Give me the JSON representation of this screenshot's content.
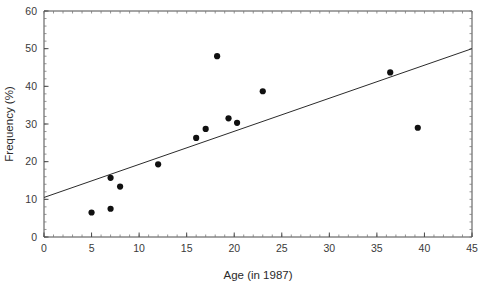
{
  "chart_data": {
    "type": "scatter",
    "title": "",
    "xlabel": "Age (in 1987)",
    "ylabel": "Frequency (%)",
    "xlim": [
      0,
      45
    ],
    "ylim": [
      0,
      60
    ],
    "xticks": [
      0,
      5,
      10,
      15,
      20,
      25,
      30,
      35,
      40,
      45
    ],
    "yticks": [
      0,
      10,
      20,
      30,
      40,
      50,
      60
    ],
    "xtick_labels": [
      "0",
      "5",
      "10",
      "15",
      "20",
      "25",
      "30",
      "35",
      "40",
      "45"
    ],
    "ytick_labels": [
      "0",
      "10",
      "20",
      "30",
      "40",
      "50",
      "60"
    ],
    "grid": false,
    "legend": null,
    "minor_ticks": true,
    "xminor_step": 1,
    "yminor_step": 2,
    "marker": "filled-circle",
    "marker_color": "#101010",
    "points": [
      {
        "x": 5.0,
        "y": 6.5
      },
      {
        "x": 7.0,
        "y": 7.5
      },
      {
        "x": 7.0,
        "y": 15.7
      },
      {
        "x": 8.0,
        "y": 13.4
      },
      {
        "x": 12.0,
        "y": 19.3
      },
      {
        "x": 16.0,
        "y": 26.3
      },
      {
        "x": 17.0,
        "y": 28.7
      },
      {
        "x": 18.2,
        "y": 48.0
      },
      {
        "x": 19.4,
        "y": 31.5
      },
      {
        "x": 20.3,
        "y": 30.3
      },
      {
        "x": 23.0,
        "y": 38.7
      },
      {
        "x": 36.4,
        "y": 43.7
      },
      {
        "x": 39.3,
        "y": 29.0
      }
    ],
    "series": [
      {
        "name": "regression-line",
        "type": "line",
        "color": "#2b2b2b",
        "endpoints": [
          {
            "x": 0,
            "y": 10.5
          },
          {
            "x": 45,
            "y": 50.0
          }
        ]
      }
    ]
  }
}
